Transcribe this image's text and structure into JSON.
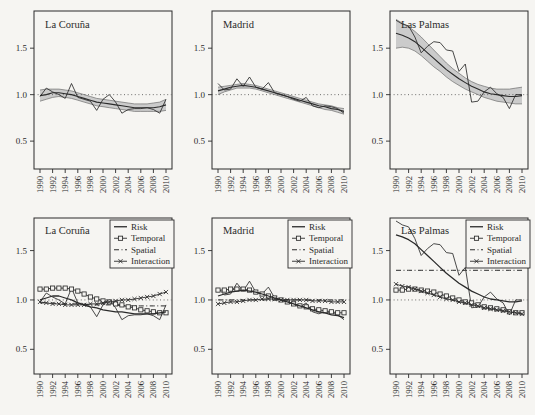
{
  "figure": {
    "background": "#f6f5f2",
    "ink": "#2b2b2b",
    "band_fill": "#cbcbcb",
    "band_edge": "#6f6f6f",
    "ref_color": "#4a4a4a",
    "legend_bg": "#f6f5f2"
  },
  "chart_data": [
    {
      "type": "line",
      "row": "top",
      "title": "La Coruña",
      "x": [
        1990,
        1991,
        1992,
        1993,
        1994,
        1995,
        1996,
        1997,
        1998,
        1999,
        2000,
        2001,
        2002,
        2003,
        2004,
        2005,
        2006,
        2007,
        2008,
        2009,
        2010
      ],
      "xticks": [
        1990,
        1992,
        1994,
        1996,
        1998,
        2000,
        2002,
        2004,
        2006,
        2008,
        2010
      ],
      "yticks": [
        "0.5",
        "1.0",
        "1.5"
      ],
      "ytick_values": [
        0.5,
        1.0,
        1.5
      ],
      "ylim": [
        0.2,
        1.9
      ],
      "refline": 1.0,
      "band": {
        "upper": [
          1.05,
          1.06,
          1.06,
          1.06,
          1.05,
          1.04,
          1.02,
          1.0,
          0.98,
          0.96,
          0.95,
          0.94,
          0.93,
          0.92,
          0.91,
          0.9,
          0.9,
          0.9,
          0.91,
          0.92,
          0.95
        ],
        "lower": [
          0.93,
          0.95,
          0.97,
          0.98,
          0.97,
          0.96,
          0.94,
          0.92,
          0.9,
          0.88,
          0.87,
          0.86,
          0.85,
          0.84,
          0.83,
          0.82,
          0.82,
          0.82,
          0.82,
          0.82,
          0.83
        ]
      },
      "series": [
        {
          "name": "SMR",
          "style": "thin",
          "values": [
            0.98,
            1.07,
            1.03,
            1.0,
            0.96,
            1.12,
            0.97,
            0.95,
            0.93,
            0.83,
            0.95,
            1.0,
            0.92,
            0.8,
            0.84,
            0.85,
            0.85,
            0.86,
            0.84,
            0.8,
            0.95
          ]
        },
        {
          "name": "Trend",
          "style": "trend",
          "values": [
            0.99,
            1.0,
            1.02,
            1.02,
            1.01,
            1.0,
            0.98,
            0.96,
            0.94,
            0.92,
            0.91,
            0.9,
            0.89,
            0.88,
            0.87,
            0.86,
            0.86,
            0.86,
            0.86,
            0.87,
            0.89
          ]
        }
      ]
    },
    {
      "type": "line",
      "row": "top",
      "title": "Madrid",
      "x": [
        1990,
        1991,
        1992,
        1993,
        1994,
        1995,
        1996,
        1997,
        1998,
        1999,
        2000,
        2001,
        2002,
        2003,
        2004,
        2005,
        2006,
        2007,
        2008,
        2009,
        2010
      ],
      "xticks": [
        1990,
        1992,
        1994,
        1996,
        1998,
        2000,
        2002,
        2004,
        2006,
        2008,
        2010
      ],
      "yticks": [
        "0.5",
        "1.0",
        "1.5"
      ],
      "ytick_values": [
        0.5,
        1.0,
        1.5
      ],
      "ylim": [
        0.2,
        1.9
      ],
      "refline": 1.0,
      "band": {
        "upper": [
          1.08,
          1.09,
          1.1,
          1.11,
          1.12,
          1.11,
          1.1,
          1.08,
          1.06,
          1.04,
          1.02,
          1.0,
          0.98,
          0.96,
          0.94,
          0.92,
          0.9,
          0.89,
          0.88,
          0.86,
          0.85
        ],
        "lower": [
          1.0,
          1.03,
          1.05,
          1.07,
          1.07,
          1.07,
          1.06,
          1.04,
          1.02,
          1.0,
          0.98,
          0.96,
          0.94,
          0.92,
          0.9,
          0.88,
          0.86,
          0.84,
          0.83,
          0.81,
          0.79
        ]
      },
      "series": [
        {
          "name": "SMR",
          "style": "thin",
          "values": [
            1.12,
            1.05,
            1.06,
            1.17,
            1.09,
            1.19,
            1.08,
            1.06,
            1.13,
            1.02,
            1.0,
            0.98,
            0.95,
            0.93,
            0.97,
            0.88,
            0.86,
            0.88,
            0.87,
            0.85,
            0.8
          ]
        },
        {
          "name": "Trend",
          "style": "trend",
          "values": [
            1.04,
            1.06,
            1.08,
            1.09,
            1.1,
            1.09,
            1.08,
            1.06,
            1.04,
            1.02,
            1.0,
            0.98,
            0.96,
            0.94,
            0.92,
            0.9,
            0.88,
            0.87,
            0.85,
            0.84,
            0.82
          ]
        }
      ]
    },
    {
      "type": "line",
      "row": "top",
      "title": "Las Palmas",
      "x": [
        1990,
        1991,
        1992,
        1993,
        1994,
        1995,
        1996,
        1997,
        1998,
        1999,
        2000,
        2001,
        2002,
        2003,
        2004,
        2005,
        2006,
        2007,
        2008,
        2009,
        2010
      ],
      "xticks": [
        1990,
        1992,
        1994,
        1996,
        1998,
        2000,
        2002,
        2004,
        2006,
        2008,
        2010
      ],
      "yticks": [
        "0.5",
        "1.0",
        "1.5"
      ],
      "ytick_values": [
        0.5,
        1.0,
        1.5
      ],
      "ylim": [
        0.2,
        1.9
      ],
      "refline": 1.0,
      "band": {
        "upper": [
          1.81,
          1.77,
          1.73,
          1.68,
          1.62,
          1.55,
          1.48,
          1.41,
          1.34,
          1.28,
          1.23,
          1.18,
          1.14,
          1.11,
          1.09,
          1.07,
          1.06,
          1.06,
          1.06,
          1.07,
          1.08
        ],
        "lower": [
          1.5,
          1.51,
          1.5,
          1.47,
          1.42,
          1.36,
          1.3,
          1.25,
          1.19,
          1.14,
          1.1,
          1.06,
          1.03,
          1.0,
          0.97,
          0.95,
          0.93,
          0.92,
          0.91,
          0.9,
          0.9
        ]
      },
      "series": [
        {
          "name": "SMR",
          "style": "thin",
          "values": [
            1.8,
            1.76,
            1.74,
            1.62,
            1.45,
            1.52,
            1.57,
            1.56,
            1.48,
            1.47,
            1.25,
            1.33,
            0.92,
            0.93,
            1.03,
            1.08,
            1.01,
            0.97,
            0.85,
            1.0,
            1.0
          ]
        },
        {
          "name": "Trend",
          "style": "trend",
          "values": [
            1.66,
            1.64,
            1.61,
            1.57,
            1.51,
            1.45,
            1.39,
            1.33,
            1.27,
            1.22,
            1.17,
            1.13,
            1.09,
            1.06,
            1.03,
            1.01,
            1.0,
            0.99,
            0.98,
            0.98,
            0.99
          ]
        }
      ]
    },
    {
      "type": "line",
      "row": "bottom",
      "title": "La Coruña",
      "x": [
        1990,
        1991,
        1992,
        1993,
        1994,
        1995,
        1996,
        1997,
        1998,
        1999,
        2000,
        2001,
        2002,
        2003,
        2004,
        2005,
        2006,
        2007,
        2008,
        2009,
        2010
      ],
      "xticks": [
        1990,
        1992,
        1994,
        1996,
        1998,
        2000,
        2002,
        2004,
        2006,
        2008,
        2010
      ],
      "yticks": [
        "0.5",
        "1.0",
        "1.5"
      ],
      "ytick_values": [
        0.5,
        1.0,
        1.5
      ],
      "ylim": [
        0.25,
        1.83
      ],
      "refline": 1.0,
      "legend": [
        {
          "label": "Risk",
          "style": "risk"
        },
        {
          "label": "Temporal",
          "style": "temporal"
        },
        {
          "label": "Spatial",
          "style": "spatial"
        },
        {
          "label": "Interaction",
          "style": "interaction"
        }
      ],
      "series": [
        {
          "name": "SMR",
          "style": "thin",
          "values": [
            0.98,
            1.07,
            1.03,
            1.0,
            0.96,
            1.12,
            0.97,
            0.95,
            0.93,
            0.83,
            0.95,
            1.0,
            0.92,
            0.8,
            0.84,
            0.85,
            0.85,
            0.86,
            0.84,
            0.8,
            0.95
          ]
        },
        {
          "name": "Spatial",
          "style": "spatial",
          "values": [
            0.97,
            0.97,
            0.97,
            0.96,
            0.96,
            0.96,
            0.96,
            0.96,
            0.95,
            0.95,
            0.95,
            0.95,
            0.95,
            0.94,
            0.94,
            0.94,
            0.94,
            0.94,
            0.94,
            0.94,
            0.94
          ]
        },
        {
          "name": "Temporal",
          "style": "temporal",
          "values": [
            1.11,
            1.11,
            1.12,
            1.12,
            1.12,
            1.11,
            1.09,
            1.06,
            1.03,
            1.01,
            0.99,
            0.98,
            0.96,
            0.95,
            0.93,
            0.92,
            0.9,
            0.89,
            0.88,
            0.87,
            0.87
          ]
        },
        {
          "name": "Interaction",
          "style": "interaction",
          "values": [
            0.98,
            0.97,
            0.96,
            0.96,
            0.95,
            0.95,
            0.95,
            0.95,
            0.96,
            0.96,
            0.97,
            0.98,
            0.99,
            1.0,
            1.0,
            1.01,
            1.02,
            1.03,
            1.04,
            1.06,
            1.08
          ]
        },
        {
          "name": "Risk",
          "style": "risk",
          "values": [
            1.0,
            1.02,
            1.04,
            1.04,
            1.02,
            1.0,
            0.97,
            0.95,
            0.93,
            0.92,
            0.9,
            0.89,
            0.88,
            0.88,
            0.87,
            0.86,
            0.86,
            0.86,
            0.86,
            0.87,
            0.88
          ]
        }
      ]
    },
    {
      "type": "line",
      "row": "bottom",
      "title": "Madrid",
      "x": [
        1990,
        1991,
        1992,
        1993,
        1994,
        1995,
        1996,
        1997,
        1998,
        1999,
        2000,
        2001,
        2002,
        2003,
        2004,
        2005,
        2006,
        2007,
        2008,
        2009,
        2010
      ],
      "xticks": [
        1990,
        1992,
        1994,
        1996,
        1998,
        2000,
        2002,
        2004,
        2006,
        2008,
        2010
      ],
      "yticks": [
        "0.5",
        "1.0",
        "1.5"
      ],
      "ytick_values": [
        0.5,
        1.0,
        1.5
      ],
      "ylim": [
        0.25,
        1.83
      ],
      "refline": 1.0,
      "legend": [
        {
          "label": "Risk",
          "style": "risk"
        },
        {
          "label": "Temporal",
          "style": "temporal"
        },
        {
          "label": "Spatial",
          "style": "spatial"
        },
        {
          "label": "Interaction",
          "style": "interaction"
        }
      ],
      "series": [
        {
          "name": "SMR",
          "style": "thin",
          "values": [
            1.12,
            1.05,
            1.06,
            1.17,
            1.09,
            1.19,
            1.08,
            1.06,
            1.13,
            1.02,
            1.0,
            0.98,
            0.95,
            0.93,
            0.97,
            0.88,
            0.86,
            0.88,
            0.87,
            0.85,
            0.8
          ]
        },
        {
          "name": "Spatial",
          "style": "spatial",
          "values": [
            1.0,
            1.0,
            1.0,
            1.0,
            1.0,
            1.0,
            1.0,
            1.0,
            1.0,
            1.0,
            1.0,
            1.0,
            1.0,
            1.0,
            1.0,
            1.0,
            1.0,
            1.0,
            1.0,
            1.0,
            1.0
          ]
        },
        {
          "name": "Temporal",
          "style": "temporal",
          "values": [
            1.1,
            1.1,
            1.11,
            1.11,
            1.11,
            1.1,
            1.08,
            1.06,
            1.04,
            1.02,
            1.0,
            0.98,
            0.96,
            0.94,
            0.93,
            0.91,
            0.9,
            0.89,
            0.88,
            0.87,
            0.87
          ]
        },
        {
          "name": "Interaction",
          "style": "interaction",
          "values": [
            0.96,
            0.97,
            0.98,
            0.98,
            0.99,
            1.0,
            1.0,
            1.01,
            1.01,
            1.01,
            1.0,
            1.0,
            1.0,
            1.0,
            1.0,
            0.99,
            0.99,
            0.99,
            0.98,
            0.98,
            0.98
          ]
        },
        {
          "name": "Risk",
          "style": "risk",
          "values": [
            1.04,
            1.06,
            1.08,
            1.09,
            1.1,
            1.09,
            1.08,
            1.06,
            1.04,
            1.02,
            1.0,
            0.98,
            0.96,
            0.94,
            0.92,
            0.9,
            0.88,
            0.87,
            0.85,
            0.84,
            0.82
          ]
        }
      ]
    },
    {
      "type": "line",
      "row": "bottom",
      "title": "Las Palmas",
      "x": [
        1990,
        1991,
        1992,
        1993,
        1994,
        1995,
        1996,
        1997,
        1998,
        1999,
        2000,
        2001,
        2002,
        2003,
        2004,
        2005,
        2006,
        2007,
        2008,
        2009,
        2010
      ],
      "xticks": [
        1990,
        1992,
        1994,
        1996,
        1998,
        2000,
        2002,
        2004,
        2006,
        2008,
        2010
      ],
      "yticks": [
        "0.5",
        "1.0",
        "1.5"
      ],
      "ytick_values": [
        0.5,
        1.0,
        1.5
      ],
      "ylim": [
        0.25,
        1.83
      ],
      "refline": 1.0,
      "legend": [
        {
          "label": "Risk",
          "style": "risk"
        },
        {
          "label": "Temporal",
          "style": "temporal"
        },
        {
          "label": "Spatial",
          "style": "spatial"
        },
        {
          "label": "Interaction",
          "style": "interaction"
        }
      ],
      "series": [
        {
          "name": "SMR",
          "style": "thin",
          "values": [
            1.8,
            1.76,
            1.74,
            1.62,
            1.45,
            1.52,
            1.57,
            1.56,
            1.48,
            1.47,
            1.25,
            1.33,
            0.92,
            0.93,
            1.03,
            1.08,
            1.01,
            0.97,
            0.85,
            1.0,
            1.0
          ]
        },
        {
          "name": "Spatial",
          "style": "spatial",
          "values": [
            1.3,
            1.3,
            1.3,
            1.3,
            1.3,
            1.3,
            1.3,
            1.3,
            1.3,
            1.3,
            1.3,
            1.3,
            1.3,
            1.3,
            1.3,
            1.3,
            1.3,
            1.3,
            1.3,
            1.3,
            1.3
          ]
        },
        {
          "name": "Temporal",
          "style": "temporal",
          "values": [
            1.1,
            1.1,
            1.11,
            1.11,
            1.1,
            1.09,
            1.08,
            1.06,
            1.04,
            1.02,
            1.0,
            0.98,
            0.97,
            0.95,
            0.93,
            0.92,
            0.91,
            0.9,
            0.88,
            0.87,
            0.87
          ]
        },
        {
          "name": "Interaction",
          "style": "interaction",
          "values": [
            1.16,
            1.14,
            1.13,
            1.11,
            1.09,
            1.07,
            1.05,
            1.03,
            1.01,
            1.0,
            0.98,
            0.97,
            0.95,
            0.94,
            0.92,
            0.91,
            0.9,
            0.89,
            0.88,
            0.87,
            0.86
          ]
        },
        {
          "name": "Risk",
          "style": "risk",
          "values": [
            1.66,
            1.64,
            1.61,
            1.57,
            1.51,
            1.45,
            1.39,
            1.33,
            1.27,
            1.22,
            1.17,
            1.13,
            1.09,
            1.06,
            1.03,
            1.01,
            1.0,
            0.99,
            0.98,
            0.98,
            0.99
          ]
        }
      ]
    }
  ]
}
